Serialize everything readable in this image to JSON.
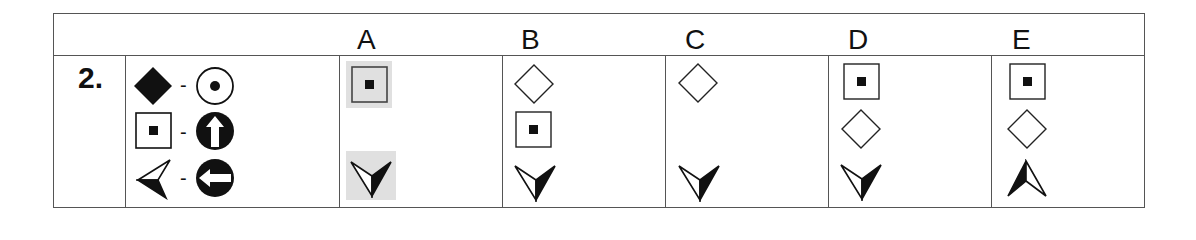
{
  "question": {
    "number": "2.",
    "legend": [
      {
        "left": "filled-diamond",
        "separator": "-",
        "right": "circle-with-dot"
      },
      {
        "left": "square-with-dot",
        "separator": "-",
        "right": "circle-arrow-up"
      },
      {
        "left": "arrowhead-left",
        "separator": "-",
        "right": "circle-arrow-left"
      }
    ]
  },
  "columns": [
    {
      "label": "A",
      "cells": [
        "square-with-dot (shaded)",
        "",
        "arrowhead-down (shaded)"
      ]
    },
    {
      "label": "B",
      "cells": [
        "outline-diamond",
        "square-with-dot",
        "arrowhead-down"
      ]
    },
    {
      "label": "C",
      "cells": [
        "outline-diamond",
        "",
        "arrowhead-down"
      ]
    },
    {
      "label": "D",
      "cells": [
        "square-with-dot",
        "outline-diamond",
        "arrowhead-down"
      ]
    },
    {
      "label": "E",
      "cells": [
        "square-with-dot",
        "outline-diamond",
        "arrowhead-up"
      ]
    }
  ],
  "colors": {
    "border": "#555555",
    "shade": "#e0e0e0",
    "ink": "#111111"
  }
}
